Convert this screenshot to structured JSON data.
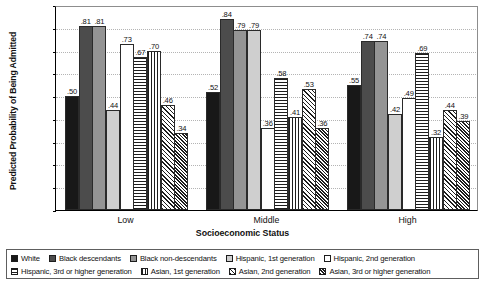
{
  "chart_data": {
    "type": "bar",
    "title": "",
    "xlabel": "Socioeconomic Status",
    "ylabel": "Predicted Probability of Being Admitted",
    "categories": [
      "Low",
      "Middle",
      "High"
    ],
    "ylim": [
      0.0,
      0.9
    ],
    "ytick_labels": [
      "0.0",
      "0.1",
      "0.2",
      "0.3",
      "0.4",
      "0.5",
      "0.6",
      "0.7",
      "0.8",
      "0.9"
    ],
    "ytick_values": [
      0.0,
      0.1,
      0.2,
      0.3,
      0.4,
      0.5,
      0.6,
      0.7,
      0.8,
      0.9
    ],
    "grid": true,
    "legend_position": "bottom",
    "series": [
      {
        "name": "White",
        "fill": "f-black",
        "values": [
          0.5,
          0.52,
          0.55
        ],
        "labels": [
          ".50",
          ".52",
          ".55"
        ]
      },
      {
        "name": "Black descendants",
        "fill": "f-darkgray",
        "values": [
          0.81,
          0.84,
          0.74
        ],
        "labels": [
          ".81",
          ".84",
          ".74"
        ]
      },
      {
        "name": "Black non-descendants",
        "fill": "f-medgray",
        "values": [
          0.81,
          0.79,
          0.74
        ],
        "labels": [
          ".81",
          ".79",
          ".74"
        ]
      },
      {
        "name": "Hispanic, 1st generation",
        "fill": "f-litegray",
        "values": [
          0.44,
          0.79,
          0.42
        ],
        "labels": [
          ".44",
          ".79",
          ".42"
        ]
      },
      {
        "name": "Hispanic, 2nd generation",
        "fill": "f-white",
        "values": [
          0.73,
          0.36,
          0.49
        ],
        "labels": [
          ".73",
          ".36",
          ".49"
        ]
      },
      {
        "name": "Hispanic, 3rd or higher generation",
        "fill": "f-horiz",
        "values": [
          0.67,
          0.58,
          0.69
        ],
        "labels": [
          ".67",
          ".58",
          ".69"
        ]
      },
      {
        "name": "Asian, 1st generation",
        "fill": "f-vert",
        "values": [
          0.7,
          0.41,
          0.32
        ],
        "labels": [
          ".70",
          ".41",
          ".32"
        ]
      },
      {
        "name": "Asian, 2nd generation",
        "fill": "f-diag",
        "values": [
          0.46,
          0.53,
          0.44
        ],
        "labels": [
          ".46",
          ".53",
          ".44"
        ]
      },
      {
        "name": "Asian, 3rd or higher generation",
        "fill": "f-check",
        "values": [
          0.34,
          0.36,
          0.39
        ],
        "labels": [
          ".34",
          ".36",
          ".39"
        ]
      }
    ]
  },
  "legend": {
    "row1": [
      {
        "label": "White",
        "fill": "f-black"
      },
      {
        "label": "Black descendants",
        "fill": "f-darkgray"
      },
      {
        "label": "Black non-descendants",
        "fill": "f-medgray"
      },
      {
        "label": "Hispanic, 1st generation",
        "fill": "f-litegray"
      },
      {
        "label": "Hispanic, 2nd generation",
        "fill": "f-white"
      }
    ],
    "row2": [
      {
        "label": "Hispanic, 3rd or higher generation",
        "fill": "f-horiz"
      },
      {
        "label": "Asian, 1st generation",
        "fill": "f-vert"
      },
      {
        "label": "Asian, 2nd generation",
        "fill": "f-diag"
      },
      {
        "label": "Asian, 3rd or higher generation",
        "fill": "f-check"
      }
    ]
  }
}
